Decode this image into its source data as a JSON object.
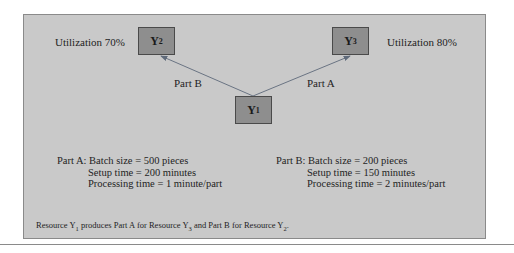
{
  "nodes": {
    "y2": {
      "label": "Y",
      "sub": "2"
    },
    "y3": {
      "label": "Y",
      "sub": "3"
    },
    "y1": {
      "label": "Y",
      "sub": "1"
    }
  },
  "utilization": {
    "y2": "Utilization 70%",
    "y3": "Utilization 80%"
  },
  "edges": {
    "y1_to_y2": "Part B",
    "y1_to_y3": "Part A"
  },
  "part_a": {
    "title": "Part A:",
    "batch": "Batch size = 500 pieces",
    "setup": "Setup time = 200 minutes",
    "processing": "Processing time = 1 minute/part"
  },
  "part_b": {
    "title": "Part B:",
    "batch": "Batch size = 200 pieces",
    "setup": "Setup time = 150 minutes",
    "processing": "Processing time = 2 minutes/part"
  },
  "caption": {
    "p1": "Resource Y",
    "s1": "1",
    "p2": " produces Part A for Resource Y",
    "s2": "3",
    "p3": " and Part B for Resource Y",
    "s3": "2",
    "p4": "."
  },
  "colors": {
    "panel": "#c9c9c9",
    "node": "#8e8e8e",
    "arrow": "#5f6a7a"
  }
}
